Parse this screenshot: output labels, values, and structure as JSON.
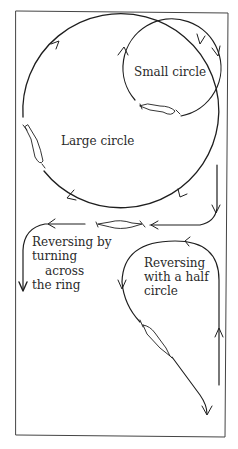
{
  "diagram": {
    "type": "riding-arena-figures",
    "colors": {
      "ink": "#1e1e1e",
      "background": "#ffffff"
    },
    "labels": {
      "small_circle": "Small circle",
      "large_circle": "Large circle",
      "reversing_across_1": "Reversing by",
      "reversing_across_2": "turning",
      "reversing_across_3": "across",
      "reversing_across_4": "the ring",
      "reversing_half_1": "Reversing",
      "reversing_half_2": "with a half",
      "reversing_half_3": "circle"
    },
    "figures": [
      {
        "name": "large-circle",
        "direction": "clockwise"
      },
      {
        "name": "small-circle",
        "direction": "clockwise"
      },
      {
        "name": "reversing-by-turning-across-the-ring"
      },
      {
        "name": "reversing-with-a-half-circle"
      }
    ]
  }
}
